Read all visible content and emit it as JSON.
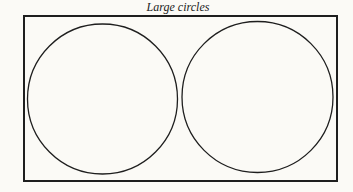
{
  "figure": {
    "title": "Large circles",
    "stroke_color": "#1e1e1e",
    "background": "#fbfaf6",
    "frame": {
      "x": 24,
      "y": 16,
      "width": 313,
      "height": 165
    },
    "circles": [
      {
        "cx": 102.5,
        "cy": 99,
        "r": 75
      },
      {
        "cx": 257.5,
        "cy": 97,
        "r": 75.5
      }
    ]
  }
}
